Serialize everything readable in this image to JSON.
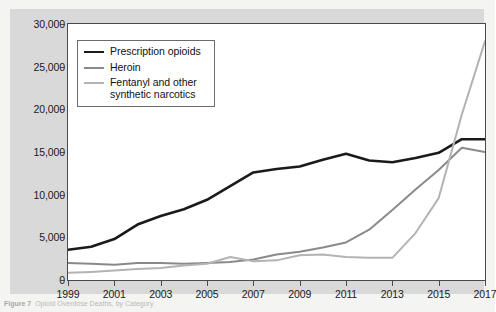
{
  "figure": {
    "caption_prefix": "Figure 7",
    "caption_text": "Opioid Overdose Deaths, by Category",
    "background_color": "#d9d9d9",
    "panel_color": "#ffffff"
  },
  "legend": {
    "position": "top-left-inside",
    "entries": [
      {
        "label": "Prescription opioids",
        "color": "#1a1a1a",
        "width": 2.6
      },
      {
        "label": "Heroin",
        "color": "#8a8a8a",
        "width": 2.0
      },
      {
        "label": "Fentanyl and other synthetic narcotics",
        "label_line1": "Fentanyl and other",
        "label_line2": "synthetic narcotics",
        "color": "#b3b3b3",
        "width": 2.0
      }
    ]
  },
  "chart_data": {
    "type": "line",
    "title": "",
    "subtitle": "",
    "xlabel": "",
    "ylabel": "",
    "xlim": [
      1999,
      2017
    ],
    "ylim": [
      0,
      30000
    ],
    "grid": false,
    "x": [
      1999,
      2000,
      2001,
      2002,
      2003,
      2004,
      2005,
      2006,
      2007,
      2008,
      2009,
      2010,
      2011,
      2012,
      2013,
      2014,
      2015,
      2016,
      2017
    ],
    "x_tick_labels": [
      "1999",
      "2001",
      "2003",
      "2005",
      "2007",
      "2009",
      "2011",
      "2013",
      "2015",
      "2017"
    ],
    "x_tick_values": [
      1999,
      2001,
      2003,
      2005,
      2007,
      2009,
      2011,
      2013,
      2015,
      2017
    ],
    "y_tick_labels": [
      "0",
      "5,000",
      "10,000",
      "15,000",
      "20,000",
      "25,000",
      "30,000"
    ],
    "y_tick_values": [
      0,
      5000,
      10000,
      15000,
      20000,
      25000,
      30000
    ],
    "series": [
      {
        "name": "Prescription opioids",
        "color": "#1a1a1a",
        "line_width": 2.6,
        "values": [
          3550,
          3900,
          4800,
          6500,
          7500,
          8300,
          9400,
          11000,
          12600,
          13000,
          13300,
          14100,
          14800,
          14000,
          13800,
          14300,
          14900,
          16500,
          16500
        ]
      },
      {
        "name": "Heroin",
        "color": "#8a8a8a",
        "line_width": 2.0,
        "values": [
          2000,
          1900,
          1800,
          2000,
          2000,
          1900,
          2000,
          2100,
          2400,
          3000,
          3300,
          3800,
          4400,
          5900,
          8200,
          10600,
          12900,
          15500,
          15000
        ]
      },
      {
        "name": "Fentanyl and other synthetic narcotics",
        "color": "#b3b3b3",
        "line_width": 2.0,
        "values": [
          850,
          950,
          1100,
          1300,
          1400,
          1700,
          1900,
          2700,
          2200,
          2300,
          2900,
          3000,
          2700,
          2600,
          2600,
          5500,
          9600,
          19400,
          28000
        ]
      }
    ]
  }
}
